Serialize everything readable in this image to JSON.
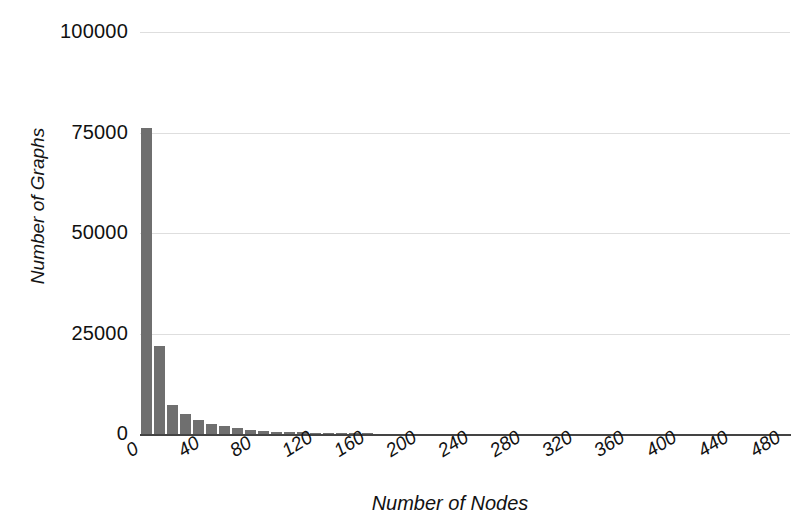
{
  "chart_data": {
    "type": "bar",
    "title": "",
    "xlabel": "Number of Nodes",
    "ylabel": "Number of Graphs",
    "xlim": [
      0,
      500
    ],
    "ylim": [
      0,
      100000
    ],
    "grid": true,
    "legend": null,
    "bar_color": "#6f6f6f",
    "bin_width": 10,
    "xticks": [
      "0",
      "40",
      "80",
      "120",
      "160",
      "200",
      "240",
      "280",
      "320",
      "360",
      "400",
      "440",
      "480"
    ],
    "xtick_values": [
      0,
      40,
      80,
      120,
      160,
      200,
      240,
      280,
      320,
      360,
      400,
      440,
      480
    ],
    "yticks": [
      "0",
      "25000",
      "50000",
      "75000",
      "100000"
    ],
    "ytick_values": [
      0,
      25000,
      50000,
      75000,
      100000
    ],
    "x": [
      5,
      15,
      25,
      35,
      45,
      55,
      65,
      75,
      85,
      95,
      105,
      115,
      125,
      135,
      145,
      155,
      165,
      175
    ],
    "bins": [
      "0-10",
      "10-20",
      "20-30",
      "30-40",
      "40-50",
      "50-60",
      "60-70",
      "70-80",
      "80-90",
      "90-100",
      "100-110",
      "110-120",
      "120-130",
      "130-140",
      "140-150",
      "150-160",
      "160-170",
      "170-180"
    ],
    "values": [
      76000,
      22000,
      7200,
      5000,
      3500,
      2500,
      1900,
      1400,
      1000,
      700,
      500,
      420,
      380,
      260,
      200,
      150,
      120,
      90
    ],
    "categories": [
      "0-10",
      "10-20",
      "20-30",
      "30-40",
      "40-50",
      "50-60",
      "60-70",
      "70-80",
      "80-90",
      "90-100",
      "100-110",
      "110-120",
      "120-130",
      "130-140",
      "140-150",
      "150-160",
      "160-170",
      "170-180"
    ]
  }
}
